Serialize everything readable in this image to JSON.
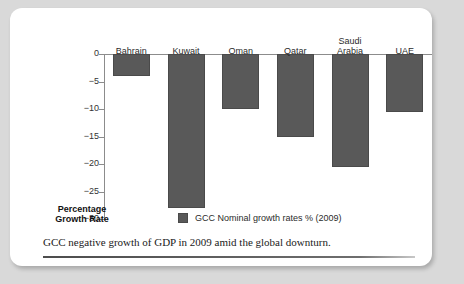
{
  "figure": {
    "caption": "GCC negative growth of GDP in 2009 amid the global downturn.",
    "axis_title_line1": "Percentage",
    "axis_title_line2": "Growth Rate"
  },
  "colors": {
    "bar_fill": "#595959",
    "bar_stroke": "#4a4a4a",
    "axis": "#8c8c8c",
    "card_background": "#ffffff",
    "page_background": "#d9d9d9"
  },
  "chart_data": {
    "type": "bar",
    "title": "",
    "subtitle": "",
    "xlabel": "",
    "ylabel": "Percentage Growth Rate",
    "ylim": [
      -30,
      0
    ],
    "yticks": [
      0,
      -5,
      -10,
      -15,
      -20,
      -25,
      -30
    ],
    "ytick_labels": [
      "0",
      "−5",
      "−10",
      "−15",
      "−20",
      "−25",
      "−30"
    ],
    "grid": false,
    "legend_position": "bottom-center",
    "legend": [
      "GCC Nominal growth rates % (2009)"
    ],
    "categories": [
      "Bahrain",
      "Kuwait",
      "Oman",
      "Qatar",
      "Saudi Arabia",
      "UAE"
    ],
    "series": [
      {
        "name": "GCC Nominal growth rates % (2009)",
        "values": [
          -4,
          -28,
          -10,
          -15,
          -20.5,
          -10.5
        ]
      }
    ]
  }
}
